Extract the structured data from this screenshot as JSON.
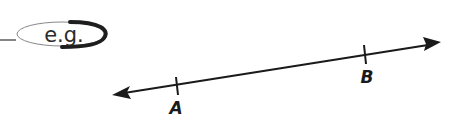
{
  "badge": {
    "text": "e.g.",
    "color": "#2a2a2a"
  },
  "diagram": {
    "type": "line-with-points",
    "points": [
      {
        "label": "A"
      },
      {
        "label": "B"
      }
    ],
    "line_color": "#1a1a1a"
  }
}
